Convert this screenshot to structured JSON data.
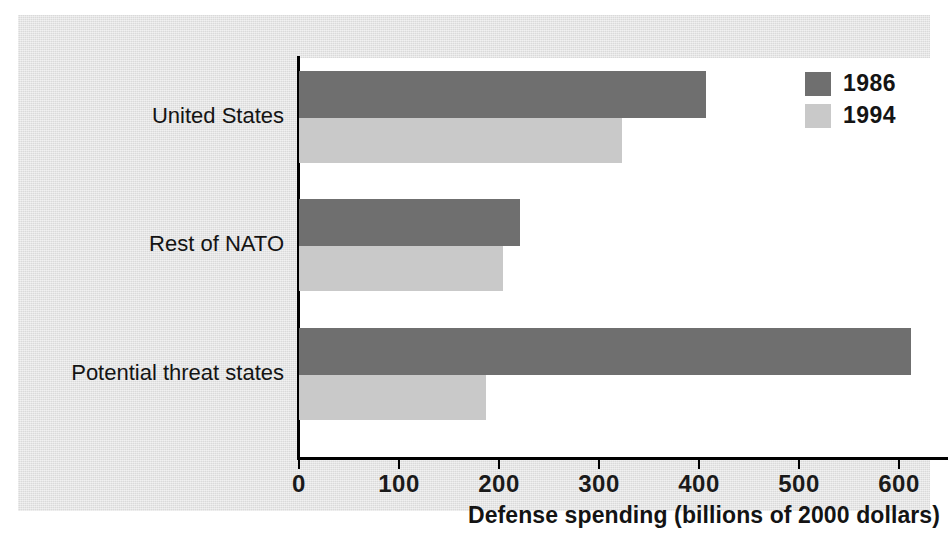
{
  "chart_data": {
    "type": "bar",
    "orientation": "horizontal",
    "title": "",
    "xlabel": "Defense spending (billions of 2000 dollars)",
    "ylabel": "",
    "categories": [
      "United States",
      "Rest of NATO",
      "Potential threat states"
    ],
    "series": [
      {
        "name": "1986",
        "color": "#6f6f6f",
        "values": [
          407,
          221,
          612
        ]
      },
      {
        "name": "1994",
        "color": "#c9c9c9",
        "values": [
          323,
          204,
          187
        ]
      }
    ],
    "xlim": [
      0,
      650
    ],
    "xticks": [
      0,
      100,
      200,
      300,
      400,
      500,
      600
    ],
    "xtick_labels": [
      "0",
      "100",
      "200",
      "300",
      "400",
      "500",
      "600"
    ],
    "grid": false,
    "legend_position": "top-right",
    "legend_entries": [
      "1986",
      "1994"
    ],
    "background_color": "#e2e2e2",
    "plot_background_color": "#ffffff",
    "axis_color": "#000000"
  }
}
